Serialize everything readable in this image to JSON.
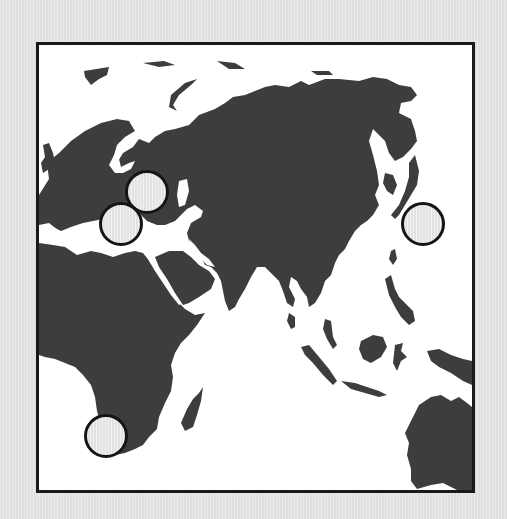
{
  "map": {
    "title": "World map (Eurasia, Africa, Oceania)",
    "colors": {
      "background": "#e4e4e4",
      "ocean": "#ffffff",
      "land": "#3d3d3d",
      "border": "#1a1a1a",
      "marker_fill": "#e9e9e9",
      "marker_stroke": "#151515"
    },
    "regions_visible": [
      "Europe",
      "Asia",
      "Africa",
      "Middle East",
      "Southeast Asia",
      "Australia",
      "Madagascar",
      "Japan"
    ],
    "markers": [
      {
        "id": "marker-eastern-europe",
        "label": "Eastern Europe",
        "x": 125,
        "y": 170
      },
      {
        "id": "marker-southern-europe",
        "label": "Southern Europe",
        "x": 99,
        "y": 202
      },
      {
        "id": "marker-japan",
        "label": "Japan",
        "x": 421,
        "y": 222
      },
      {
        "id": "marker-south-africa",
        "label": "South Africa",
        "x": 104,
        "y": 434
      }
    ]
  }
}
